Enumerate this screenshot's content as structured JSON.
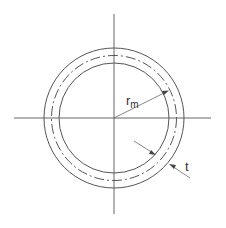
{
  "diagram": {
    "title": "",
    "labels": {
      "mean_radius": "r",
      "mean_radius_subscript": "m",
      "thickness": "t"
    },
    "geometry": {
      "center": [
        114,
        118
      ],
      "outer_radius": 70,
      "mean_radius": 62.5,
      "inner_radius": 55
    },
    "colors": {
      "line": "#555555",
      "background": "#ffffff"
    }
  }
}
